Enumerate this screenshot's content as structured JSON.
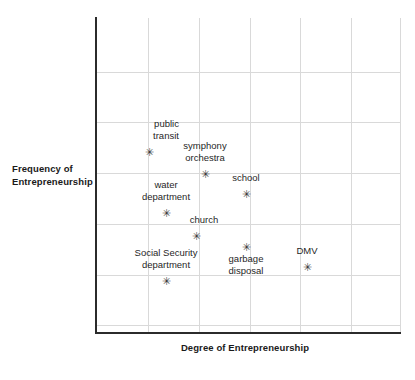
{
  "chart_data": {
    "type": "scatter",
    "title": "",
    "xlabel": "Degree of Entrepreneurship",
    "ylabel": "Frequency of Entrepreneurship",
    "xlim": [
      0,
      6
    ],
    "ylim": [
      0,
      6
    ],
    "xticklabels": [],
    "yticklabels": [],
    "grid": true,
    "legend": null,
    "marker": "asterisk",
    "points": [
      {
        "label": "public\ntransit",
        "x": 1.0,
        "y": 3.6
      },
      {
        "label": "symphony\norchestra",
        "x": 2.1,
        "y": 3.15
      },
      {
        "label": "school",
        "x": 2.95,
        "y": 2.75
      },
      {
        "label": "water\ndepartment",
        "x": 1.35,
        "y": 2.4
      },
      {
        "label": "church",
        "x": 1.95,
        "y": 1.9
      },
      {
        "label": "garbage\ndisposal",
        "x": 2.95,
        "y": 1.7
      },
      {
        "label": "DMV",
        "x": 4.1,
        "y": 1.33
      },
      {
        "label": "Social Security\ndepartment",
        "x": 1.35,
        "y": 1.05
      }
    ]
  },
  "plot": {
    "axis_color": "#2b2b2b",
    "grid_color": "#d9d9d9",
    "marker_glyph": "✳",
    "points": [
      {
        "name": "public-transit",
        "marker_x": 149,
        "marker_y": 151,
        "label_lines": [
          "public",
          "transit"
        ],
        "label_x": 166,
        "label_y": 118,
        "align": "right"
      },
      {
        "name": "symphony-orchestra",
        "marker_x": 205,
        "marker_y": 173,
        "label_lines": [
          "symphony",
          "orchestra"
        ],
        "label_x": 205,
        "label_y": 140,
        "align": "center"
      },
      {
        "name": "school",
        "marker_x": 246,
        "marker_y": 193,
        "label_lines": [
          "school"
        ],
        "label_x": 246,
        "label_y": 172,
        "align": "center"
      },
      {
        "name": "water-department",
        "marker_x": 166,
        "marker_y": 212,
        "label_lines": [
          "water",
          "department"
        ],
        "label_x": 166,
        "label_y": 179,
        "align": "center"
      },
      {
        "name": "church",
        "marker_x": 196,
        "marker_y": 235,
        "label_lines": [
          "church"
        ],
        "label_x": 204,
        "label_y": 214,
        "align": "center"
      },
      {
        "name": "garbage-disposal",
        "marker_x": 246,
        "marker_y": 246,
        "label_lines": [
          "garbage",
          "disposal"
        ],
        "label_x": 246,
        "label_y": 253,
        "align": "center"
      },
      {
        "name": "dmv",
        "marker_x": 307,
        "marker_y": 266,
        "label_lines": [
          "DMV"
        ],
        "label_x": 307,
        "label_y": 245,
        "align": "center"
      },
      {
        "name": "social-security-department",
        "marker_x": 166,
        "marker_y": 280,
        "label_lines": [
          "Social Security",
          "department"
        ],
        "label_x": 166,
        "label_y": 247,
        "align": "center"
      }
    ],
    "gridlines_v": [
      148,
      199,
      250,
      300,
      351,
      400
    ],
    "gridlines_h": [
      72,
      122,
      173,
      224,
      275,
      325
    ]
  }
}
